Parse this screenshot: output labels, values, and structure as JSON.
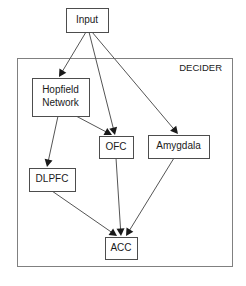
{
  "figure": {
    "type": "block-diagram",
    "background_color": "#ffffff",
    "width": 246,
    "height": 286
  },
  "container": {
    "label": "DECIDER",
    "border_color": "#808080",
    "x": 17,
    "y": 58,
    "width": 215,
    "height": 208,
    "label_x": 222,
    "label_y": 68,
    "font_size": 9.5
  },
  "nodes": [
    {
      "id": "input",
      "label": "Input",
      "x": 66,
      "y": 8,
      "width": 42,
      "height": 24,
      "font_size": 10,
      "lines": [
        "Input"
      ],
      "inside_container": false
    },
    {
      "id": "hopfield",
      "label": "Hopfield Network",
      "x": 32,
      "y": 78,
      "width": 57,
      "height": 38,
      "font_size": 10,
      "lines": [
        "Hopfield",
        "Network"
      ],
      "inside_container": true
    },
    {
      "id": "ofc",
      "label": "OFC",
      "x": 99,
      "y": 136,
      "width": 34,
      "height": 22,
      "font_size": 10,
      "lines": [
        "OFC"
      ],
      "inside_container": true
    },
    {
      "id": "amygdala",
      "label": "Amygdala",
      "x": 148,
      "y": 135,
      "width": 61,
      "height": 23,
      "font_size": 10,
      "lines": [
        "Amygdala"
      ],
      "inside_container": true
    },
    {
      "id": "dlpfc",
      "label": "DLPFC",
      "x": 29,
      "y": 168,
      "width": 46,
      "height": 23,
      "font_size": 10,
      "lines": [
        "DLPFC"
      ],
      "inside_container": true
    },
    {
      "id": "acc",
      "label": "ACC",
      "x": 105,
      "y": 237,
      "width": 32,
      "height": 22,
      "font_size": 10,
      "lines": [
        "ACC"
      ],
      "inside_container": true
    }
  ],
  "edges": [
    {
      "id": "input-to-hopfield",
      "from": "input",
      "to": "hopfield",
      "x1": 86,
      "y1": 32,
      "x2": 59,
      "y2": 77,
      "arrowhead": true
    },
    {
      "id": "input-to-ofc",
      "from": "input",
      "to": "ofc",
      "x1": 89,
      "y1": 32,
      "x2": 115,
      "y2": 135,
      "arrowhead": true
    },
    {
      "id": "input-to-amygdala",
      "from": "input",
      "to": "amygdala",
      "x1": 92,
      "y1": 32,
      "x2": 178,
      "y2": 134,
      "arrowhead": true
    },
    {
      "id": "hopfield-to-ofc",
      "from": "hopfield",
      "to": "ofc",
      "x1": 76,
      "y1": 116,
      "x2": 112,
      "y2": 135,
      "arrowhead": true
    },
    {
      "id": "hopfield-to-dlpfc",
      "from": "hopfield",
      "to": "dlpfc",
      "x1": 58,
      "y1": 116,
      "x2": 47,
      "y2": 167,
      "arrowhead": true
    },
    {
      "id": "ofc-to-acc",
      "from": "ofc",
      "to": "acc",
      "x1": 116,
      "y1": 158,
      "x2": 121,
      "y2": 236,
      "arrowhead": true
    },
    {
      "id": "dlpfc-to-acc",
      "from": "dlpfc",
      "to": "acc",
      "x1": 52,
      "y1": 191,
      "x2": 117,
      "y2": 236,
      "arrowhead": true
    },
    {
      "id": "amygdala-to-acc",
      "from": "amygdala",
      "to": "acc",
      "x1": 174,
      "y1": 158,
      "x2": 126,
      "y2": 236,
      "arrowhead": true
    }
  ],
  "colors": {
    "node_stroke": "#4d4d4d",
    "container_stroke": "#808080",
    "edge_stroke": "#555555",
    "text": "#1a1a1a",
    "background": "#ffffff"
  }
}
